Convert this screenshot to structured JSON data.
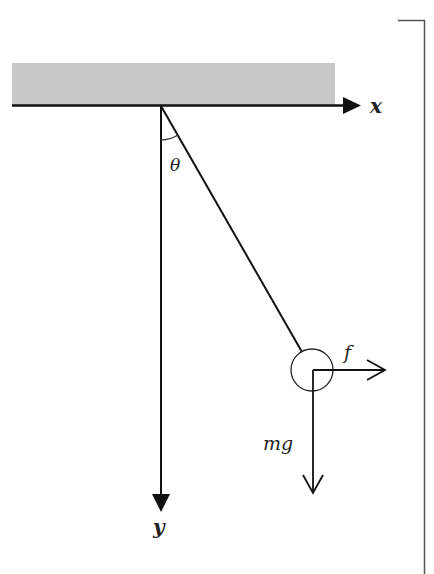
{
  "diagram": {
    "type": "pendulum-free-body",
    "labels": {
      "x_axis": "x",
      "y_axis": "y",
      "angle": "θ",
      "force_horizontal": "f",
      "force_gravity": "mg"
    },
    "colors": {
      "ceiling": "#c8c8c8",
      "stroke": "#222222",
      "background": "#ffffff"
    }
  }
}
